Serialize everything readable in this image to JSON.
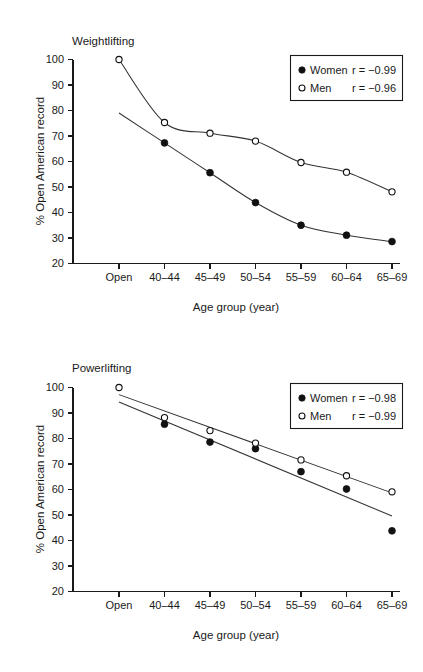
{
  "figure": {
    "panel_count": 2,
    "background_color": "#ffffff",
    "foreground_color": "#1a1a1a"
  },
  "chart_data": [
    {
      "type": "scatter",
      "title": "Weightlifting",
      "xlabel": "Age group (year)",
      "ylabel": "% Open American record",
      "categories": [
        "Open",
        "40–44",
        "45–49",
        "50–54",
        "55–59",
        "60–64",
        "65–69"
      ],
      "yticks": [
        20,
        30,
        40,
        50,
        60,
        70,
        80,
        90,
        100
      ],
      "ylim": [
        20,
        100
      ],
      "grid": false,
      "legend_position": "upper right",
      "series": [
        {
          "name": "Women",
          "marker": "filled-circle",
          "color": "#111111",
          "r_label": "r = −0.99",
          "r_value": -0.99,
          "x": [
            "40–44",
            "45–49",
            "50–54",
            "55–59",
            "60–64",
            "65–69"
          ],
          "values": [
            67.3,
            55.6,
            43.9,
            35.0,
            31.1,
            28.6
          ],
          "fit": "exponential decay"
        },
        {
          "name": "Men",
          "marker": "open-circle",
          "color": "#111111",
          "r_label": "r = −0.96",
          "r_value": -0.96,
          "x": [
            "Open",
            "40–44",
            "45–49",
            "50–54",
            "55–59",
            "60–64",
            "65–69"
          ],
          "values": [
            100.0,
            75.3,
            71.1,
            68.0,
            59.6,
            55.8,
            48.1
          ],
          "fit": "exponential decay"
        }
      ],
      "legend": [
        {
          "name": "Women",
          "marker": "filled-circle",
          "r_label": "r = −0.99"
        },
        {
          "name": "Men",
          "marker": "open-circle",
          "r_label": "r = −0.96"
        }
      ]
    },
    {
      "type": "scatter",
      "title": "Powerlifting",
      "xlabel": "Age group (year)",
      "ylabel": "% Open American record",
      "categories": [
        "Open",
        "40–44",
        "45–49",
        "50–54",
        "55–59",
        "60–64",
        "65–69"
      ],
      "yticks": [
        20,
        30,
        40,
        50,
        60,
        70,
        80,
        90,
        100
      ],
      "ylim": [
        20,
        100
      ],
      "grid": false,
      "legend_position": "upper right",
      "series": [
        {
          "name": "Women",
          "marker": "filled-circle",
          "color": "#111111",
          "r_label": "r = −0.98",
          "r_value": -0.98,
          "x": [
            "40–44",
            "45–49",
            "50–54",
            "55–59",
            "60–64",
            "65–69"
          ],
          "values": [
            85.6,
            78.6,
            76.0,
            67.0,
            60.2,
            43.8
          ],
          "fit": "linear"
        },
        {
          "name": "Men",
          "marker": "open-circle",
          "color": "#111111",
          "r_label": "r = −0.99",
          "r_value": -0.99,
          "x": [
            "Open",
            "40–44",
            "45–49",
            "50–54",
            "55–59",
            "60–64",
            "65–69"
          ],
          "values": [
            100.0,
            88.2,
            83.1,
            78.2,
            71.6,
            65.4,
            59.1
          ],
          "fit": "linear"
        }
      ],
      "legend": [
        {
          "name": "Women",
          "marker": "filled-circle",
          "r_label": "r = −0.98"
        },
        {
          "name": "Men",
          "marker": "open-circle",
          "r_label": "r = −0.99"
        }
      ]
    }
  ]
}
